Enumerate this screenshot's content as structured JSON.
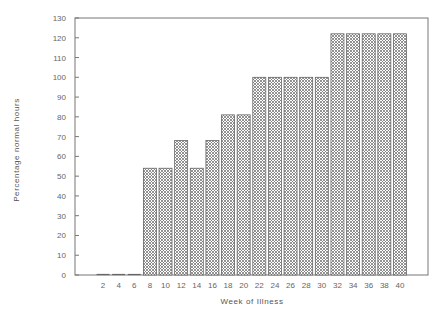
{
  "chart_data": {
    "type": "bar",
    "title": "",
    "xlabel": "Week of Illness",
    "ylabel": "Percentage normal hours",
    "ylim": [
      0,
      130
    ],
    "yticks": [
      0,
      10,
      20,
      30,
      40,
      50,
      60,
      70,
      80,
      90,
      100,
      110,
      120,
      130
    ],
    "grid": false,
    "legend": null,
    "categories": [
      "2",
      "4",
      "6",
      "8",
      "10",
      "12",
      "14",
      "16",
      "18",
      "20",
      "22",
      "24",
      "26",
      "28",
      "30",
      "32",
      "34",
      "36",
      "38",
      "40"
    ],
    "values": [
      0,
      0,
      0,
      54,
      54,
      68,
      54,
      68,
      81,
      81,
      100,
      100,
      100,
      100,
      100,
      122,
      122,
      122,
      122,
      122
    ],
    "bar_pattern": "crosshatch",
    "colors": {
      "frame": "#777777",
      "bar_fill": "#999999",
      "bar_edge": "#666666"
    }
  }
}
